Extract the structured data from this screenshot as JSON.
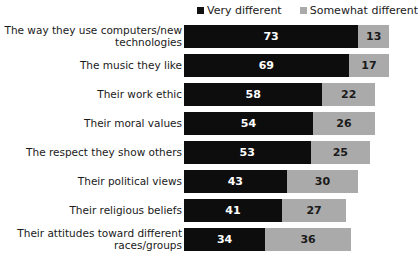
{
  "chart_data": {
    "type": "bar",
    "orientation": "horizontal",
    "stacked": true,
    "title": "",
    "subtitle": "",
    "xlabel": "",
    "ylabel": "",
    "grid": false,
    "xlim": [
      0,
      86
    ],
    "legend_position": "top-right",
    "categories": [
      "The way they use computers/new\ntechnologies",
      "The music they like",
      "Their work ethic",
      "Their moral values",
      "The respect they show others",
      "Their political views",
      "Their religious beliefs",
      "Their attitudes toward different\nraces/groups"
    ],
    "series": [
      {
        "name": "Very different",
        "color": "#0d0d0d",
        "values": [
          73,
          69,
          58,
          54,
          53,
          43,
          41,
          34
        ]
      },
      {
        "name": "Somewhat different",
        "color": "#aaaaaa",
        "values": [
          13,
          17,
          22,
          26,
          25,
          30,
          27,
          36
        ]
      }
    ]
  },
  "legend": {
    "entries": [
      {
        "label": "Very different",
        "swatch": "legend-swatch-dark"
      },
      {
        "label": "Somewhat different",
        "swatch": "legend-swatch-light"
      }
    ]
  },
  "colors": {
    "very_different": "#0d0d0d",
    "somewhat_different": "#aaaaaa",
    "background": "#ffffff",
    "text": "#1a1a1a"
  }
}
